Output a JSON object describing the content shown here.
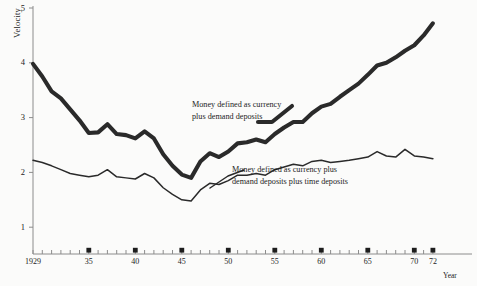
{
  "chart_data": {
    "type": "line",
    "title": "",
    "xlabel": "Year",
    "ylabel": "Velocity",
    "xlim": [
      1929,
      1972
    ],
    "ylim": [
      0,
      5
    ],
    "grid": false,
    "legend_position": "inline-annotation",
    "y_ticks": [
      1,
      2,
      3,
      4,
      5
    ],
    "y_tick_labels": [
      "1",
      "2",
      "3",
      "4",
      "5"
    ],
    "x_ticks": [
      1929,
      1935,
      1940,
      1945,
      1950,
      1955,
      1960,
      1965,
      1970,
      1972
    ],
    "x_tick_labels": [
      "1929",
      "35",
      "40",
      "45",
      "50",
      "55",
      "60",
      "65",
      "70",
      "72"
    ],
    "x_minor_tick_interval": 1,
    "x_marked_years": [
      1935,
      1940,
      1945,
      1950,
      1955,
      1960,
      1965,
      1970,
      1972
    ],
    "series": [
      {
        "name": "Money defined as currency plus demand deposits",
        "style": "thick",
        "color": "#2a2a2a",
        "x": [
          1929,
          1930,
          1931,
          1932,
          1933,
          1934,
          1935,
          1936,
          1937,
          1938,
          1939,
          1940,
          1941,
          1942,
          1943,
          1944,
          1945,
          1946,
          1947,
          1948,
          1949,
          1950,
          1951,
          1952,
          1953,
          1954,
          1955,
          1956,
          1957,
          1958,
          1959,
          1960,
          1961,
          1962,
          1963,
          1964,
          1965,
          1966,
          1967,
          1968,
          1969,
          1970,
          1971,
          1972
        ],
        "values": [
          3.98,
          3.75,
          3.48,
          3.35,
          3.15,
          2.95,
          2.72,
          2.73,
          2.88,
          2.7,
          2.68,
          2.62,
          2.75,
          2.62,
          2.33,
          2.12,
          1.96,
          1.9,
          2.2,
          2.35,
          2.28,
          2.38,
          2.53,
          2.55,
          2.6,
          2.55,
          2.7,
          2.82,
          2.92,
          2.92,
          3.08,
          3.2,
          3.25,
          3.38,
          3.5,
          3.62,
          3.78,
          3.95,
          4.0,
          4.1,
          4.22,
          4.32,
          4.5,
          4.72
        ]
      },
      {
        "name": "Money defined as currency plus demand deposits plus time deposits",
        "style": "thin",
        "color": "#2a2a2a",
        "x": [
          1929,
          1930,
          1931,
          1932,
          1933,
          1934,
          1935,
          1936,
          1937,
          1938,
          1939,
          1940,
          1941,
          1942,
          1943,
          1944,
          1945,
          1946,
          1947,
          1948,
          1949,
          1950,
          1951,
          1952,
          1953,
          1954,
          1955,
          1956,
          1957,
          1958,
          1959,
          1960,
          1961,
          1962,
          1963,
          1964,
          1965,
          1966,
          1967,
          1968,
          1969,
          1970,
          1971,
          1972
        ],
        "values": [
          2.22,
          2.18,
          2.12,
          2.05,
          1.98,
          1.95,
          1.92,
          1.95,
          2.05,
          1.92,
          1.9,
          1.88,
          1.98,
          1.9,
          1.72,
          1.6,
          1.5,
          1.48,
          1.68,
          1.8,
          1.78,
          1.85,
          1.95,
          1.95,
          1.98,
          1.95,
          2.05,
          2.1,
          2.15,
          2.12,
          2.2,
          2.22,
          2.18,
          2.2,
          2.22,
          2.25,
          2.28,
          2.38,
          2.3,
          2.28,
          2.42,
          2.3,
          2.28,
          2.25
        ]
      }
    ],
    "annotations": [
      {
        "id": "m1-label",
        "lines": [
          "Money defined as currency",
          "plus demand deposits"
        ]
      },
      {
        "id": "m2-label",
        "lines": [
          "Money defined as currency plus",
          "demand deposits plus time deposits"
        ]
      }
    ]
  },
  "axis": {
    "y_title": "Velocity",
    "x_title": "Year"
  },
  "colors": {
    "line": "#2a2a2a",
    "axis": "#8c8c8c",
    "text": "#232323",
    "background": "#fbfbfa"
  }
}
